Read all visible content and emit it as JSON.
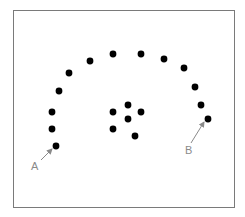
{
  "diagram": {
    "frame": {
      "x": 13,
      "y": 10,
      "width": 221,
      "height": 197,
      "stroke": "#7a7a7a"
    },
    "dot_color": "#000000",
    "dot_radius": 3.4,
    "arc_dots": [
      {
        "x": 56,
        "y": 146
      },
      {
        "x": 52,
        "y": 129
      },
      {
        "x": 52,
        "y": 112
      },
      {
        "x": 59,
        "y": 91
      },
      {
        "x": 69,
        "y": 73
      },
      {
        "x": 90,
        "y": 61
      },
      {
        "x": 113,
        "y": 54
      },
      {
        "x": 141,
        "y": 54
      },
      {
        "x": 164,
        "y": 59
      },
      {
        "x": 184,
        "y": 68
      },
      {
        "x": 195,
        "y": 87
      },
      {
        "x": 201,
        "y": 105
      },
      {
        "x": 208,
        "y": 119
      }
    ],
    "cluster_dots": [
      {
        "x": 128,
        "y": 105
      },
      {
        "x": 113,
        "y": 112
      },
      {
        "x": 141,
        "y": 112
      },
      {
        "x": 128,
        "y": 119
      },
      {
        "x": 113,
        "y": 129
      },
      {
        "x": 135,
        "y": 136
      }
    ],
    "annotations": [
      {
        "label": "A",
        "text_x": 31,
        "text_y": 170,
        "arrow_from": {
          "x": 41,
          "y": 160
        },
        "arrow_to": {
          "x": 52,
          "y": 149
        }
      },
      {
        "label": "B",
        "text_x": 185,
        "text_y": 154,
        "arrow_from": {
          "x": 191,
          "y": 143
        },
        "arrow_to": {
          "x": 204,
          "y": 122
        }
      }
    ],
    "annotation_color": "#8a8a8a"
  }
}
